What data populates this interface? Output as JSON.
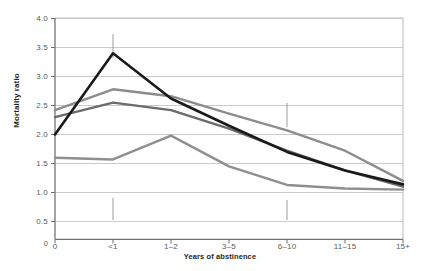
{
  "chart_data": {
    "type": "line",
    "title": "",
    "xlabel": "Years of abstinence",
    "ylabel": "Mortality ratio",
    "categories": [
      "0",
      "<1",
      "1–2",
      "3–5",
      "6–10",
      "11–15",
      "15+"
    ],
    "ylim": [
      0.5,
      4.0
    ],
    "yticks": [
      0.5,
      1.0,
      1.5,
      2.0,
      2.5,
      3.0,
      3.5,
      4.0
    ],
    "ytick_labels": [
      "0.5",
      "1.0",
      "1.5",
      "2.0",
      "2.5",
      "3.0",
      "3.5",
      "4.0"
    ],
    "grid": true,
    "legend": "annotations-inline",
    "series": [
      {
        "name": "Females, 19+ cigarettes per day",
        "color": "#1a1a1a",
        "values": [
          2.0,
          3.4,
          2.62,
          2.15,
          1.7,
          1.38,
          1.14
        ]
      },
      {
        "name": "Males, 20+ cigarettes per day",
        "color": "#8c8c8c",
        "values": [
          2.42,
          2.78,
          2.66,
          2.36,
          2.07,
          1.72,
          1.2
        ]
      },
      {
        "name": "Males, 1–20 cigarettes per day",
        "color": "#6b6b6b",
        "values": [
          2.3,
          2.55,
          2.42,
          2.1,
          1.72,
          1.38,
          1.1
        ]
      },
      {
        "name": "Females, 1–19 cigarettes per day",
        "color": "#8f8f8f",
        "values": [
          1.6,
          1.57,
          1.98,
          1.45,
          1.13,
          1.07,
          1.05
        ]
      }
    ],
    "annotations": [
      {
        "text": "Females, 19+ cigarettes per day",
        "anchor_category": "<1",
        "style": "dark",
        "leader": "down"
      },
      {
        "text": "Males, 20+ cigarettes per day",
        "anchor_category": "6–10",
        "style": "gray",
        "leader": "down"
      },
      {
        "text": "Males, 1–20 cigarettes per day",
        "anchor_category": "<1",
        "style": "dark",
        "leader": "up"
      },
      {
        "text": "Females, 1–19 cigarettes per day",
        "anchor_category": "6–10",
        "style": "dark",
        "leader": "up"
      }
    ]
  },
  "axes": {
    "y_title": "Mortality ratio",
    "x_title": "Years of abstinence",
    "y_labels": [
      "4.0",
      "3.5",
      "3.0",
      "2.5",
      "2.0",
      "1.5",
      "1.0",
      "0.5",
      "0"
    ],
    "x_labels": [
      "0",
      "<1",
      "1–2",
      "3–5",
      "6–10",
      "11–15",
      "15+"
    ]
  },
  "annotations": {
    "a0": "Females, 19+ cigarettes per day",
    "a1": "Males, 20+ cigarettes per day",
    "a2": "Males, 1–20 cigarettes per day",
    "a3": "Females, 1–19 cigarettes per day"
  },
  "colors": {
    "series_dark": "#1a1a1a",
    "series_gray_light": "#8c8c8c",
    "series_gray_mid": "#6b6b6b",
    "series_gray_low": "#8f8f8f",
    "grid": "#c9cacc",
    "axis": "#6d6e70",
    "text": "#231f20"
  }
}
